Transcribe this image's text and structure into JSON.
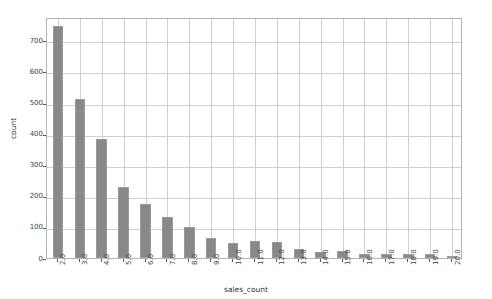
{
  "chart_data": {
    "type": "bar",
    "title": "",
    "subtitle": "",
    "xlabel": "sales_count",
    "ylabel": "count",
    "categories": [
      "2.0",
      "3.0",
      "4.0",
      "5.0",
      "6.0",
      "7.0",
      "8.0",
      "9.0",
      "10.0",
      "11.0",
      "12.0",
      "13.0",
      "14.0",
      "15.0",
      "16.0",
      "17.0",
      "18.0",
      "19.0",
      "20.0"
    ],
    "values": [
      745,
      512,
      382,
      228,
      173,
      131,
      101,
      65,
      48,
      55,
      50,
      30,
      20,
      22,
      13,
      13,
      12,
      12,
      8
    ],
    "series": [
      {
        "name": "count",
        "values": [
          745,
          512,
          382,
          228,
          173,
          131,
          101,
          65,
          48,
          55,
          50,
          30,
          20,
          22,
          13,
          13,
          12,
          12,
          8
        ]
      }
    ],
    "ylim": [
      0,
      775
    ],
    "xlim": [
      1.5,
      20.5
    ],
    "yticks": [
      0,
      100,
      200,
      300,
      400,
      500,
      600,
      700
    ],
    "ytick_labels": [
      "0",
      "100",
      "200",
      "300",
      "400",
      "500",
      "600",
      "700"
    ],
    "xtick_labels": [
      "2.0",
      "3.0",
      "4.0",
      "5.0",
      "6.0",
      "7.0",
      "8.0",
      "9.0",
      "10.0",
      "11.0",
      "12.0",
      "13.0",
      "14.0",
      "15.0",
      "16.0",
      "17.0",
      "18.0",
      "19.0",
      "20.0"
    ],
    "grid": true,
    "grid_axis": "both",
    "legend": false,
    "legend_position": "none",
    "bar_color": "#888888",
    "bar_edge_color": "#9a9a9a",
    "grid_color": "#cfcfcf",
    "axis_color": "#b4b4b4",
    "background_color": "#ffffff",
    "tick_label_rotation_x": 90,
    "annotations": []
  }
}
